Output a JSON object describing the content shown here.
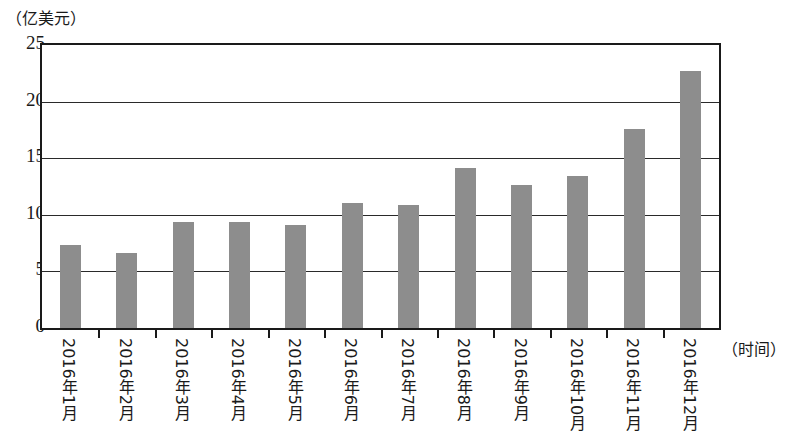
{
  "chart_data": {
    "type": "bar",
    "title": "",
    "subtitle": "",
    "ylabel": "（亿美元）",
    "xlabel": "（时间）",
    "categories": [
      "2016年1月",
      "2016年2月",
      "2016年3月",
      "2016年4月",
      "2016年5月",
      "2016年6月",
      "2016年7月",
      "2016年8月",
      "2016年9月",
      "2016年10月",
      "2016年11月",
      "2016年12月"
    ],
    "values": [
      7.3,
      6.6,
      9.4,
      9.4,
      9.1,
      11.0,
      10.9,
      14.1,
      12.6,
      13.4,
      17.6,
      22.7
    ],
    "ylim": [
      0,
      25
    ],
    "yticks": [
      0,
      5,
      10,
      15,
      20,
      25
    ],
    "ytick_labels": [
      "0",
      "5",
      "10",
      "15",
      "20",
      "25"
    ],
    "grid": true,
    "legend": false,
    "legend_position": "none",
    "bar_color": "#8d8d8d",
    "axis_color": "#1a1a1a"
  }
}
